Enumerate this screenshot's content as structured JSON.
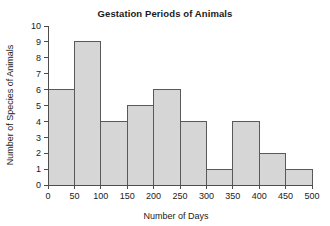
{
  "chart_data": {
    "type": "bar",
    "title": "Gestation Periods of Animals",
    "xlabel": "Number of Days",
    "ylabel": "Number of Species of Animals",
    "categories": [
      "0-50",
      "50-100",
      "100-150",
      "150-200",
      "200-250",
      "250-300",
      "300-350",
      "350-400",
      "400-450",
      "450-500"
    ],
    "bin_edges": [
      0,
      50,
      100,
      150,
      200,
      250,
      300,
      350,
      400,
      450,
      500
    ],
    "bin_width": 50,
    "values": [
      6,
      9,
      4,
      5,
      6,
      4,
      1,
      4,
      2,
      1
    ],
    "xlim": [
      0,
      500
    ],
    "ylim": [
      0,
      10
    ],
    "x_ticks": [
      0,
      50,
      100,
      150,
      200,
      250,
      300,
      350,
      400,
      450,
      500
    ],
    "x_tick_labels": [
      "0",
      "50",
      "100",
      "150",
      "200",
      "250",
      "300",
      "350",
      "400",
      "450",
      "500"
    ],
    "y_ticks": [
      0,
      1,
      2,
      3,
      4,
      5,
      6,
      7,
      8,
      9,
      10
    ],
    "y_tick_labels": [
      "0",
      "1",
      "2",
      "3",
      "4",
      "5",
      "6",
      "7",
      "8",
      "9",
      "10"
    ],
    "grid": false,
    "legend": false,
    "bar_fill": "#d6d6d6",
    "bar_stroke": "#595959",
    "axis_color": "#4d4d4d",
    "text_color": "#1a1a1a",
    "background": "#ffffff"
  }
}
